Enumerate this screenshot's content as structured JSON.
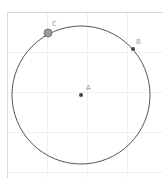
{
  "app": "geometry-canvas",
  "colors": {
    "background": "#ffffff",
    "border": "#d8d8d8",
    "grid": "#f0f0f0",
    "circle": "#555555",
    "point": "#444444",
    "point_selected": "#888888",
    "label": "#999999"
  },
  "canvas": {
    "frame": {
      "x": 7,
      "y": 12,
      "width": 156,
      "height": 166
    },
    "grid_lines_x": [
      47,
      87,
      127
    ],
    "grid_lines_y": [
      52,
      92,
      132,
      172
    ]
  },
  "circle": {
    "cx": 81,
    "cy": 95,
    "r": 69
  },
  "points": [
    {
      "name": "A",
      "x": 81,
      "y": 95,
      "label": "A",
      "label_dx": 5,
      "label_dy": -5,
      "selected": false
    },
    {
      "name": "B",
      "x": 133,
      "y": 49,
      "label": "B",
      "label_dx": 3,
      "label_dy": -5,
      "selected": false
    },
    {
      "name": "C",
      "x": 48,
      "y": 33,
      "label": "C",
      "label_dx": 4,
      "label_dy": -7,
      "selected": true
    }
  ]
}
